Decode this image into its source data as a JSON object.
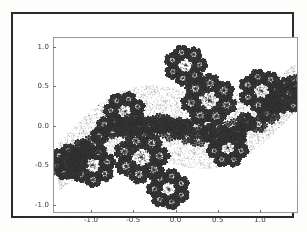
{
  "figure": {
    "background_color": "#ffffff",
    "border_color": "#2b2b2b",
    "axes_frame_color": "#9a9a9a",
    "tick_color": "#6e6e6e",
    "tick_label_color": "#3a3a3a"
  },
  "chart_data": {
    "type": "scatter",
    "title": "",
    "subtitle": "",
    "xlabel": "",
    "ylabel": "",
    "legend": [],
    "legend_position": "none",
    "grid": false,
    "xlim": [
      -1.45,
      1.45
    ],
    "ylim": [
      -1.1,
      1.12
    ],
    "xticks": [
      -1.0,
      -0.5,
      0.0,
      0.5,
      1.0
    ],
    "yticks": [
      -1.0,
      -0.5,
      0.0,
      0.5,
      1.0
    ],
    "xticklabels": [
      "-1.0",
      "-0.5",
      "0.0",
      "0.5",
      "1.0"
    ],
    "yticklabels": [
      "-1.0",
      "-0.5",
      "0.0",
      "0.5",
      "1.0"
    ],
    "marker": "point",
    "marker_size": 0.9,
    "marker_color": "#4a4a4a",
    "point_count": 60000,
    "attractor_centers": [
      {
        "x": -0.42,
        "y": -0.38,
        "weight": 1.0
      },
      {
        "x": 0.38,
        "y": 0.34,
        "weight": 1.0
      },
      {
        "x": -1.0,
        "y": -0.48,
        "weight": 0.62
      },
      {
        "x": 1.0,
        "y": 0.46,
        "weight": 0.62
      },
      {
        "x": 0.1,
        "y": 0.78,
        "weight": 0.5
      },
      {
        "x": -0.1,
        "y": -0.78,
        "weight": 0.5
      },
      {
        "x": -0.62,
        "y": 0.2,
        "weight": 0.45
      },
      {
        "x": 0.6,
        "y": -0.26,
        "weight": 0.45
      },
      {
        "x": -1.28,
        "y": -0.44,
        "weight": 0.3
      },
      {
        "x": 1.3,
        "y": 0.4,
        "weight": 0.3
      }
    ],
    "series": [
      {
        "name": "fractal attractor",
        "color": "#4a4a4a",
        "x": [],
        "y": []
      }
    ]
  }
}
